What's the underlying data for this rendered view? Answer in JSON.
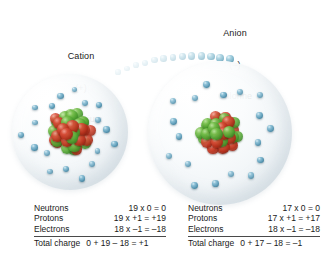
{
  "diagram": {
    "colors": {
      "proton": "#b4301c",
      "neutron": "#4a9e2e",
      "electron": "#5d9cb8",
      "shell": "#eef3f6",
      "text": "#1a1a1a",
      "rule": "#4a4a4a"
    }
  },
  "labels": {
    "cation": {
      "line1": "Cation",
      "line2": "(+)",
      "line3": "Potassium"
    },
    "anion": {
      "line1": "Anion",
      "line2": "(–)",
      "line3": "Chlorine"
    }
  },
  "atoms": {
    "potassium": {
      "name": "Potassium",
      "ion": "cation",
      "charge_sign": "+",
      "neutrons": 19,
      "protons": 19,
      "electrons": 18,
      "electron_count_drawn": 18,
      "nucleon_count_drawn": 38
    },
    "chlorine": {
      "name": "Chlorine",
      "ion": "anion",
      "charge_sign": "–",
      "neutrons": 17,
      "protons": 17,
      "electrons": 18,
      "electron_count_drawn": 18,
      "nucleon_count_drawn": 34
    }
  },
  "transfer": {
    "description": "electron trail from potassium to chlorine",
    "bead_count": 13
  },
  "calc_potassium": {
    "rows": [
      {
        "key": "Neutrons",
        "value": "19 x 0 = 0"
      },
      {
        "key": "Protons",
        "value": "19 x +1 = +19"
      },
      {
        "key": "Electrons",
        "value": "18 x –1 = –18"
      }
    ],
    "total": {
      "key": "Total charge",
      "value": "0 + 19 – 18 = +1"
    }
  },
  "calc_chlorine": {
    "rows": [
      {
        "key": "Neutrons",
        "value": "17 x 0 = 0"
      },
      {
        "key": "Protons",
        "value": "17 x +1 = +17"
      },
      {
        "key": "Electrons",
        "value": "18 x –1 = –18"
      }
    ],
    "total": {
      "key": "Total charge",
      "value": "0 + 17 – 18 = –1"
    }
  }
}
